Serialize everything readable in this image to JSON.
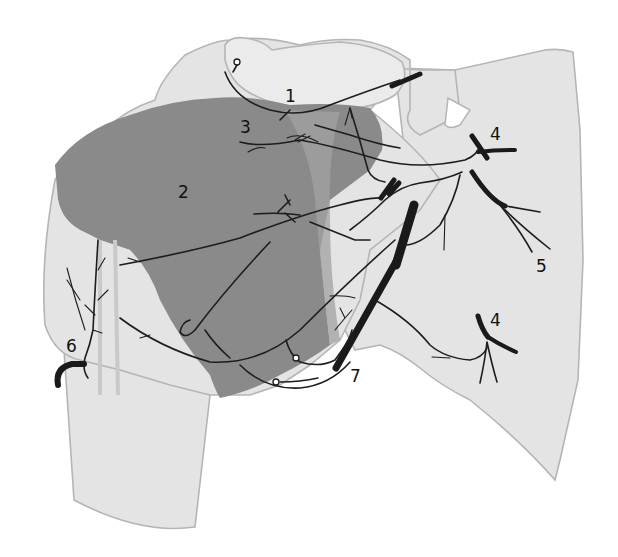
{
  "figure": {
    "colors": {
      "bone": "#e4e4e4",
      "bone_outline": "#b5b5b5",
      "muscle_region": "#8a8a8a",
      "muscle_region_light": "#a8a8a8",
      "nerve": "#1d1d1d",
      "background": "#ffffff"
    },
    "labels": [
      {
        "id": "1",
        "text": "1"
      },
      {
        "id": "2",
        "text": "2"
      },
      {
        "id": "3",
        "text": "3"
      },
      {
        "id": "4a",
        "text": "4"
      },
      {
        "id": "4b",
        "text": "4"
      },
      {
        "id": "5",
        "text": "5"
      },
      {
        "id": "6",
        "text": "6"
      },
      {
        "id": "7",
        "text": "7"
      }
    ]
  }
}
